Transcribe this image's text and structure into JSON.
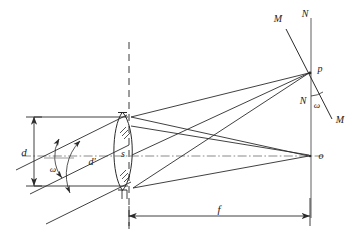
{
  "figure": {
    "background_color": "#ffffff",
    "line_color": "#2b2b2b",
    "label_color": "#1a1a1a"
  },
  "labels": {
    "aperture_diameter": "d",
    "effective_aperture": "d'",
    "field_angle_left": "ω",
    "field_angle_right": "ω",
    "lens_glass": "s",
    "focal_length": "f",
    "image_point_offaxis": "p",
    "image_point_axial": "o",
    "normal_top": "N",
    "normal_bottom": "N",
    "tilted_top": "M",
    "tilted_bottom": "M"
  },
  "geometry": {
    "lens_center_x": 129,
    "lens_top_y": 113,
    "lens_bottom_y": 189,
    "focal_plane_x": 311,
    "axis_y": 156,
    "point_p_y": 72,
    "point_o_y": 156,
    "dim_d_x": 34,
    "dim_d_top_y": 117,
    "dim_d_bottom_y": 186,
    "dim_f_y": 216
  },
  "elements": {
    "optical_axis_style": "dash-dot",
    "lens_plane_style": "dashed",
    "lens_shape": "biconvex",
    "hatch_marks": 2,
    "rays_to_p": 3,
    "rays_to_o": 3
  }
}
